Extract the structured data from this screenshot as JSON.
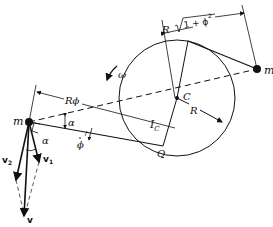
{
  "diagram": {
    "labels": {
      "mass_right": "m",
      "mass_left": "m",
      "center": "C",
      "radius": "R",
      "omega": "ω",
      "inertia": "I",
      "inertia_sub": "C",
      "point_q": "Q",
      "arc_length": "Rϕ",
      "length_R": "R",
      "sqrt_inner": "1 + ϕ",
      "sqrt_exp": "2",
      "alpha_top": "α",
      "alpha_side": "α",
      "phi_dot": "ϕ",
      "v": "v",
      "v1": "v",
      "v1_sub": "1",
      "v2": "v",
      "v2_sub": "2"
    },
    "colors": {
      "ink": "#111111",
      "background": "#ffffff"
    }
  }
}
